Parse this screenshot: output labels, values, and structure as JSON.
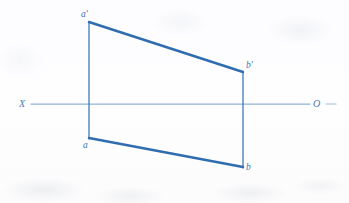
{
  "figure": {
    "kind": "descriptive-geometry-projection-drawing",
    "canvas": {
      "width": 349,
      "height": 203
    },
    "background_color": "#fefeff",
    "line_color_primary": "#2f6cb0",
    "line_color_axis": "#8fb3d6",
    "label_color": "#3f72b0"
  },
  "axis": {
    "left_label": "X",
    "right_label": "O",
    "y": 104,
    "x_start": 31,
    "x_end": 310,
    "tick_after_o_start": 326,
    "tick_after_o_end": 336,
    "left_label_x": 19,
    "left_label_y": 99,
    "right_label_x": 313,
    "right_label_y": 99
  },
  "points": [
    {
      "id": "a-prime",
      "label": "a'",
      "x": 89,
      "y": 22,
      "view": "front",
      "label_x": 81,
      "label_y": 10
    },
    {
      "id": "b-prime",
      "label": "b'",
      "x": 243,
      "y": 72,
      "view": "front",
      "label_x": 246,
      "label_y": 61
    },
    {
      "id": "a",
      "label": "a",
      "x": 89,
      "y": 138,
      "view": "top",
      "label_x": 83,
      "label_y": 141
    },
    {
      "id": "b",
      "label": "b",
      "x": 243,
      "y": 167,
      "view": "top",
      "label_x": 246,
      "label_y": 163
    }
  ],
  "segments": [
    {
      "id": "front-view-line",
      "from": "a-prime",
      "to": "b-prime",
      "x1": 89,
      "y1": 22,
      "x2": 243,
      "y2": 72,
      "width": 2.4
    },
    {
      "id": "top-view-line",
      "from": "a",
      "to": "b",
      "x1": 89,
      "y1": 138,
      "x2": 243,
      "y2": 167,
      "width": 2.4
    },
    {
      "id": "projector-left",
      "from": "a-prime",
      "to": "a",
      "x1": 89,
      "y1": 22,
      "x2": 89,
      "y2": 139,
      "width": 1.3
    },
    {
      "id": "projector-right",
      "from": "b-prime",
      "to": "b",
      "x1": 243,
      "y1": 72,
      "x2": 243,
      "y2": 168,
      "width": 1.3
    }
  ]
}
